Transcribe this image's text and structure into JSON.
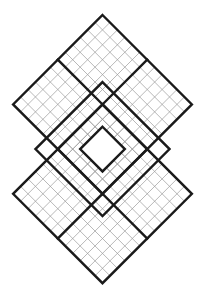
{
  "puzzle": {
    "title": "Overlapping diamond sudoku grid",
    "type": "samurai-style diamond sudoku",
    "colors": {
      "background": "#ffffff",
      "thin_line": "#9a9a9a",
      "bold_line": "#1a1a1a"
    },
    "geometry": {
      "origin_x": 102.5,
      "origin_y": 15,
      "step": 7.45
    },
    "grids": [
      {
        "name": "top-diamond",
        "a0": 0,
        "b0": 0,
        "size": 12
      },
      {
        "name": "bottom-diamond",
        "a0": 6,
        "b0": 6,
        "size": 12
      }
    ],
    "middle_frame": {
      "a0": 4.5,
      "b0": 4.5,
      "size": 9
    },
    "center_hole": {
      "a0": 7.5,
      "b0": 7.5,
      "size": 3
    },
    "cells": []
  }
}
